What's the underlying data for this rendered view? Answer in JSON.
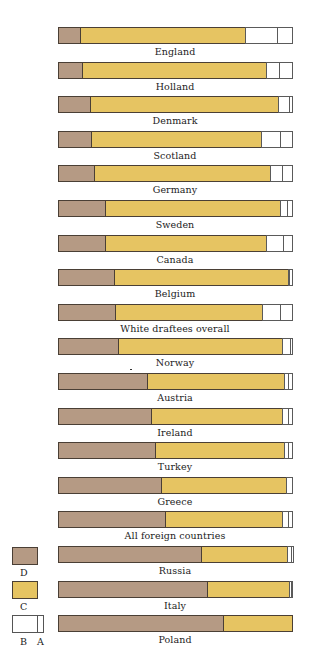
{
  "colors": {
    "D": "#b59a84",
    "C": "#e6c462",
    "B": "#ffffff",
    "A": "#ffffff"
  },
  "legend": [
    {
      "key": "D",
      "label": "D"
    },
    {
      "key": "C",
      "label": "C"
    },
    {
      "key": "B",
      "label": "B"
    },
    {
      "key": "A",
      "label": "A"
    }
  ],
  "chart_data": {
    "type": "bar",
    "orientation": "horizontal",
    "stacked": true,
    "normalized_to": 100,
    "title": "",
    "xlabel": "",
    "ylabel": "",
    "xlim": [
      0,
      100
    ],
    "grid": false,
    "legend_position": "bottom-left",
    "segment_order": [
      "D",
      "C",
      "B",
      "A"
    ],
    "categories": [
      "England",
      "Holland",
      "Denmark",
      "Scotland",
      "Germany",
      "Sweden",
      "Canada",
      "Belgium",
      "White draftees overall",
      "Norway",
      "Austria",
      "Ireland",
      "Turkey",
      "Greece",
      "All foreign countries",
      "Russia",
      "Italy",
      "Poland"
    ],
    "series": [
      {
        "name": "D",
        "values": [
          9.4,
          10.3,
          13.7,
          14.1,
          15.4,
          20.1,
          20.1,
          23.9,
          24.4,
          25.8,
          38.2,
          39.9,
          41.6,
          44.2,
          45.9,
          61.0,
          63.8,
          70.3
        ]
      },
      {
        "name": "C",
        "values": [
          70.5,
          78.6,
          80.3,
          72.6,
          75.2,
          74.8,
          68.8,
          74.4,
          62.8,
          70.0,
          58.4,
          55.8,
          54.9,
          53.2,
          49.8,
          36.8,
          34.9,
          29.7
        ]
      },
      {
        "name": "B",
        "values": [
          13.7,
          5.6,
          4.7,
          8.1,
          5.1,
          3.0,
          7.3,
          0.4,
          7.7,
          3.4,
          1.7,
          2.6,
          1.7,
          2.6,
          2.6,
          1.7,
          0.9,
          0.0
        ]
      },
      {
        "name": "A",
        "values": [
          6.4,
          5.6,
          1.3,
          5.1,
          4.3,
          2.1,
          3.8,
          1.3,
          5.1,
          0.9,
          1.7,
          1.7,
          1.7,
          0.0,
          1.7,
          0.9,
          0.4,
          0.0
        ]
      }
    ]
  }
}
